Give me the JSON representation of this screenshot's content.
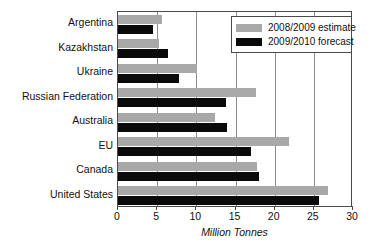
{
  "chart_data": {
    "type": "bar",
    "orientation": "horizontal",
    "title": "",
    "xlabel": "Million Tonnes",
    "ylabel": "",
    "xlim": [
      0,
      30
    ],
    "xticks": [
      0,
      5,
      10,
      15,
      20,
      25,
      30
    ],
    "grid": true,
    "grid_axis": "x",
    "legend_position": "top-right",
    "categories": [
      "Argentina",
      "Kazakhstan",
      "Ukraine",
      "Russian Federation",
      "Australia",
      "EU",
      "Canada",
      "United States"
    ],
    "series": [
      {
        "name": "2008/2009 estimate",
        "color": "#a8a8a8",
        "values": [
          5.6,
          5.2,
          10.1,
          17.6,
          12.4,
          21.8,
          17.7,
          26.8
        ]
      },
      {
        "name": "2009/2010 forecast",
        "color": "#0a0a0a",
        "values": [
          4.5,
          6.4,
          7.8,
          13.8,
          13.9,
          17.0,
          18.0,
          25.7
        ]
      }
    ]
  },
  "legend": {
    "items": [
      {
        "label": "2008/2009 estimate",
        "color": "#a8a8a8"
      },
      {
        "label": "2009/2010 forecast",
        "color": "#0a0a0a"
      }
    ]
  },
  "axis": {
    "x_title": "Million Tonnes",
    "x_tick_labels": [
      "0",
      "5",
      "10",
      "15",
      "20",
      "25",
      "30"
    ]
  }
}
